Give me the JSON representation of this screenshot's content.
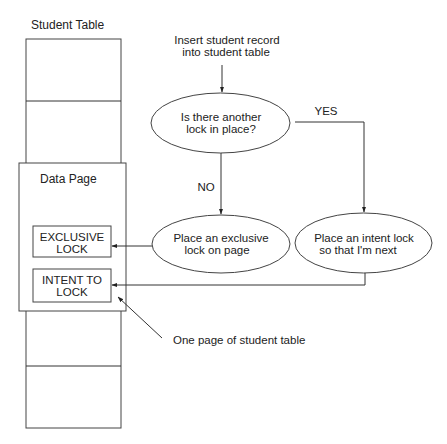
{
  "student_table": {
    "title": "Student Table"
  },
  "data_page": {
    "title": "Data Page",
    "locks": [
      {
        "line1": "EXCLUSIVE",
        "line2": "LOCK"
      },
      {
        "line1": "INTENT TO",
        "line2": "LOCK"
      }
    ]
  },
  "flowchart": {
    "start": {
      "line1": "Insert student record",
      "line2": "into student table"
    },
    "decision": {
      "line1": "Is there another",
      "line2": "lock in place?"
    },
    "no_label": "NO",
    "yes_label": "YES",
    "exclusive_action": {
      "line1": "Place an exclusive",
      "line2": "lock on page"
    },
    "intent_action": {
      "line1": "Place an intent lock",
      "line2": "so that I'm next"
    }
  },
  "annotation": {
    "text": "One page of student table"
  },
  "colors": {
    "line": "#333333",
    "text": "#222222",
    "background": "#ffffff"
  }
}
